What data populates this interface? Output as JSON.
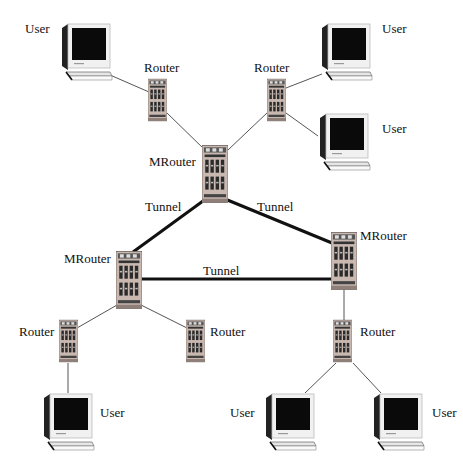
{
  "diagram": {
    "type": "network-topology",
    "nodes": [
      {
        "id": "user1",
        "kind": "user",
        "label": "User",
        "x": 58,
        "y": 22
      },
      {
        "id": "router1",
        "kind": "router",
        "label": "Router",
        "x": 148,
        "y": 78
      },
      {
        "id": "user2",
        "kind": "user",
        "label": "User",
        "x": 318,
        "y": 22
      },
      {
        "id": "router2",
        "kind": "router",
        "label": "Router",
        "x": 267,
        "y": 78
      },
      {
        "id": "user3",
        "kind": "user",
        "label": "User",
        "x": 316,
        "y": 112
      },
      {
        "id": "mrouter1",
        "kind": "mrouter",
        "label": "MRouter",
        "x": 202,
        "y": 145
      },
      {
        "id": "mrouter2",
        "kind": "mrouter",
        "label": "MRouter",
        "x": 116,
        "y": 251
      },
      {
        "id": "mrouter3",
        "kind": "mrouter",
        "label": "MRouter",
        "x": 331,
        "y": 232
      },
      {
        "id": "router3",
        "kind": "router",
        "label": "Router",
        "x": 59,
        "y": 319
      },
      {
        "id": "router4",
        "kind": "router",
        "label": "Router",
        "x": 186,
        "y": 319
      },
      {
        "id": "router5",
        "kind": "router",
        "label": "Router",
        "x": 333,
        "y": 319
      },
      {
        "id": "user4",
        "kind": "user",
        "label": "User",
        "x": 40,
        "y": 392
      },
      {
        "id": "user5",
        "kind": "user",
        "label": "User",
        "x": 262,
        "y": 392
      },
      {
        "id": "user6",
        "kind": "user",
        "label": "User",
        "x": 370,
        "y": 392
      }
    ],
    "labels": [
      {
        "for": "user1",
        "text": "User",
        "x": 25,
        "y": 22
      },
      {
        "for": "router1",
        "text": "Router",
        "x": 144,
        "y": 61
      },
      {
        "for": "user2",
        "text": "User",
        "x": 382,
        "y": 22
      },
      {
        "for": "router2",
        "text": "Router",
        "x": 254,
        "y": 61
      },
      {
        "for": "user3",
        "text": "User",
        "x": 382,
        "y": 122
      },
      {
        "for": "mrouter1",
        "text": "MRouter",
        "x": 149,
        "y": 155
      },
      {
        "for": "tunnel1",
        "text": "Tunnel",
        "x": 145,
        "y": 200
      },
      {
        "for": "tunnel2",
        "text": "Tunnel",
        "x": 257,
        "y": 200
      },
      {
        "for": "mrouter3",
        "text": "MRouter",
        "x": 360,
        "y": 229
      },
      {
        "for": "mrouter2",
        "text": "MRouter",
        "x": 64,
        "y": 252
      },
      {
        "for": "tunnel3",
        "text": "Tunnel",
        "x": 203,
        "y": 264
      },
      {
        "for": "router3",
        "text": "Router",
        "x": 19,
        "y": 325
      },
      {
        "for": "router4",
        "text": "Router",
        "x": 210,
        "y": 325
      },
      {
        "for": "router5",
        "text": "Router",
        "x": 360,
        "y": 325
      },
      {
        "for": "user4",
        "text": "User",
        "x": 100,
        "y": 406
      },
      {
        "for": "user5",
        "text": "User",
        "x": 230,
        "y": 406
      },
      {
        "for": "user6",
        "text": "User",
        "x": 432,
        "y": 406
      }
    ],
    "edges": [
      {
        "from": "user1",
        "to": "router1",
        "style": "thin",
        "x1": 110,
        "y1": 75,
        "x2": 149,
        "y2": 92
      },
      {
        "from": "router1",
        "to": "mrouter1",
        "style": "thin",
        "x1": 166,
        "y1": 112,
        "x2": 205,
        "y2": 150
      },
      {
        "from": "router2",
        "to": "mrouter1",
        "style": "thin",
        "x1": 268,
        "y1": 112,
        "x2": 228,
        "y2": 150
      },
      {
        "from": "router2",
        "to": "user2",
        "style": "thin",
        "x1": 286,
        "y1": 88,
        "x2": 322,
        "y2": 74
      },
      {
        "from": "router2",
        "to": "user3",
        "style": "thin",
        "x1": 286,
        "y1": 113,
        "x2": 318,
        "y2": 136
      },
      {
        "from": "mrouter1",
        "to": "mrouter2",
        "style": "tunnel",
        "label": "Tunnel",
        "x1": 203,
        "y1": 201,
        "x2": 133,
        "y2": 252
      },
      {
        "from": "mrouter1",
        "to": "mrouter3",
        "style": "tunnel",
        "label": "Tunnel",
        "x1": 225,
        "y1": 199,
        "x2": 332,
        "y2": 243
      },
      {
        "from": "mrouter2",
        "to": "mrouter3",
        "style": "tunnel",
        "label": "Tunnel",
        "x1": 141,
        "y1": 279,
        "x2": 332,
        "y2": 279
      },
      {
        "from": "mrouter2",
        "to": "router3",
        "style": "thin",
        "x1": 117,
        "y1": 305,
        "x2": 77,
        "y2": 328
      },
      {
        "from": "mrouter2",
        "to": "router4",
        "style": "thin",
        "x1": 141,
        "y1": 305,
        "x2": 187,
        "y2": 328
      },
      {
        "from": "router3",
        "to": "user4",
        "style": "thin",
        "x1": 68,
        "y1": 363,
        "x2": 68,
        "y2": 393
      },
      {
        "from": "mrouter3",
        "to": "router5",
        "style": "thin",
        "x1": 344,
        "y1": 288,
        "x2": 344,
        "y2": 320
      },
      {
        "from": "router5",
        "to": "user5",
        "style": "thin",
        "x1": 336,
        "y1": 363,
        "x2": 305,
        "y2": 393
      },
      {
        "from": "router5",
        "to": "user6",
        "style": "thin",
        "x1": 353,
        "y1": 363,
        "x2": 381,
        "y2": 393
      }
    ]
  },
  "colors": {
    "background": "#ffffff",
    "thin_link": "#555555",
    "tunnel_link": "#111111",
    "router_body": "#c9b8b0",
    "router_accent": "#d9c7c0",
    "monitor_frame": "#f1f1f1",
    "monitor_screen": "#0a0a0a",
    "label_text": "#111111"
  }
}
